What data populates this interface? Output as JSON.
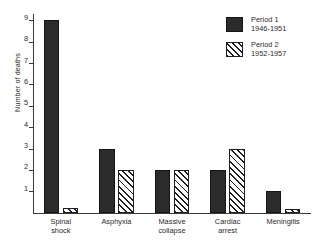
{
  "chart_data": {
    "type": "bar",
    "title": "",
    "xlabel": "",
    "ylabel": "Number of deaths",
    "ylim": [
      0,
      9.3
    ],
    "ytick_labels": [
      "1",
      "2",
      "3",
      "4",
      "5",
      "6",
      "7",
      "8",
      "9"
    ],
    "ytick_values": [
      1,
      2,
      3,
      4,
      5,
      6,
      7,
      8,
      9
    ],
    "grid": false,
    "legend_position": "top-right",
    "categories": [
      "Spinal shock",
      "Asphyxia",
      "Massive collapse",
      "Cardiac arrest",
      "Meningitis"
    ],
    "category_lines": [
      [
        "Spinal",
        "shock"
      ],
      [
        "Asphyxia"
      ],
      [
        "Massive",
        "collapse"
      ],
      [
        "Cardiac",
        "arrest"
      ],
      [
        "Meningitis"
      ]
    ],
    "series": [
      {
        "name": "Period 1",
        "subtitle": "1946-1951",
        "fill": "solid-black",
        "color": "#2b2b2b",
        "values": [
          9,
          3,
          2,
          2,
          1
        ]
      },
      {
        "name": "Period 2",
        "subtitle": "1952-1957",
        "fill": "diagonal-hatch",
        "color": "#1f1f1f",
        "values": [
          0.2,
          2,
          2,
          3,
          0.15
        ]
      }
    ]
  },
  "legend": {
    "entries": [
      {
        "label": "Period 1",
        "years": "1946-1951"
      },
      {
        "label": "Period 2",
        "years": "1952-1957"
      }
    ]
  }
}
